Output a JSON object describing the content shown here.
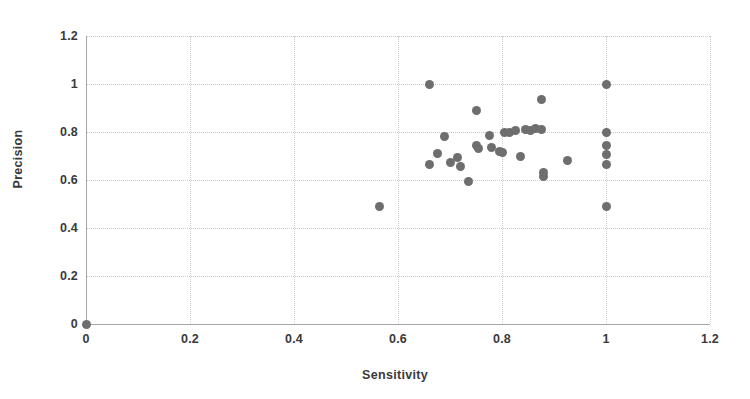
{
  "chart_data": {
    "type": "scatter",
    "title": "",
    "xlabel": "Sensitivity",
    "ylabel": "Precision",
    "xlim": [
      0,
      1.2
    ],
    "ylim": [
      0,
      1.2
    ],
    "grid": true,
    "legend": "none",
    "marker_color": "#6e6e6e",
    "xticks": [
      "0",
      "0.2",
      "0.4",
      "0.6",
      "0.8",
      "1",
      "1.2"
    ],
    "xtick_values": [
      0,
      0.2,
      0.4,
      0.6,
      0.8,
      1,
      1.2
    ],
    "yticks": [
      "0",
      "0.2",
      "0.4",
      "0.6",
      "0.8",
      "1",
      "1.2"
    ],
    "ytick_values": [
      0,
      0.2,
      0.4,
      0.6,
      0.8,
      1,
      1.2
    ],
    "series": [
      {
        "name": "models",
        "points": [
          [
            0.0,
            0.0
          ],
          [
            0.565,
            0.49
          ],
          [
            0.66,
            1.0
          ],
          [
            0.66,
            0.665
          ],
          [
            0.675,
            0.71
          ],
          [
            0.69,
            0.78
          ],
          [
            0.7,
            0.675
          ],
          [
            0.715,
            0.695
          ],
          [
            0.72,
            0.655
          ],
          [
            0.735,
            0.595
          ],
          [
            0.75,
            0.89
          ],
          [
            0.75,
            0.745
          ],
          [
            0.755,
            0.73
          ],
          [
            0.775,
            0.785
          ],
          [
            0.78,
            0.735
          ],
          [
            0.795,
            0.72
          ],
          [
            0.8,
            0.715
          ],
          [
            0.805,
            0.8
          ],
          [
            0.815,
            0.8
          ],
          [
            0.825,
            0.805
          ],
          [
            0.835,
            0.7
          ],
          [
            0.845,
            0.81
          ],
          [
            0.855,
            0.805
          ],
          [
            0.865,
            0.815
          ],
          [
            0.875,
            0.935
          ],
          [
            0.875,
            0.81
          ],
          [
            0.88,
            0.63
          ],
          [
            0.88,
            0.615
          ],
          [
            0.925,
            0.68
          ],
          [
            1.0,
            1.0
          ],
          [
            1.0,
            0.8
          ],
          [
            1.0,
            0.745
          ],
          [
            1.0,
            0.705
          ],
          [
            1.0,
            0.665
          ],
          [
            1.0,
            0.49
          ]
        ]
      }
    ]
  },
  "axes": {
    "x_title": "Sensitivity",
    "y_title": "Precision"
  }
}
